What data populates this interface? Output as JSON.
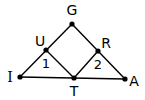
{
  "diagram": {
    "type": "geometry-figure",
    "stroke_color": "#000000",
    "background": "#ffffff",
    "points": [
      {
        "id": "G",
        "label": "G",
        "x": 72,
        "y": 24,
        "label_x": 72,
        "label_y": 10
      },
      {
        "id": "U",
        "label": "U",
        "x": 46,
        "y": 50,
        "label_x": 40,
        "label_y": 41
      },
      {
        "id": "R",
        "label": "R",
        "x": 98,
        "y": 51,
        "label_x": 106,
        "label_y": 43
      },
      {
        "id": "I",
        "label": "I",
        "x": 20,
        "y": 77,
        "label_x": 10,
        "label_y": 77
      },
      {
        "id": "T",
        "label": "T",
        "x": 74,
        "y": 78,
        "label_x": 74,
        "label_y": 91
      },
      {
        "id": "A",
        "label": "A",
        "x": 125,
        "y": 79,
        "label_x": 134,
        "label_y": 81
      }
    ],
    "segments": [
      {
        "from": "I",
        "to": "G"
      },
      {
        "from": "G",
        "to": "A"
      },
      {
        "from": "I",
        "to": "A"
      },
      {
        "from": "U",
        "to": "T"
      },
      {
        "from": "T",
        "to": "R"
      }
    ],
    "angle_labels": [
      {
        "label": "1",
        "x": 46,
        "y": 63
      },
      {
        "label": "2",
        "x": 98,
        "y": 64
      }
    ]
  }
}
